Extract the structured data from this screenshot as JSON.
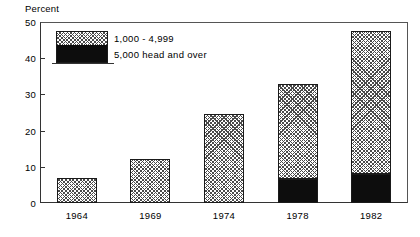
{
  "chart_data": {
    "type": "bar",
    "subtype": "stacked",
    "title": "",
    "ylabel": "Percent",
    "xlabel": "",
    "categories": [
      "1964",
      "1969",
      "1974",
      "1978",
      "1982"
    ],
    "series": [
      {
        "name": "1,000 - 4,999",
        "values": [
          7.0,
          12.2,
          24.5,
          26.3,
          39.5
        ],
        "style": "hatched"
      },
      {
        "name": "5,000 head and over",
        "values": [
          0.0,
          0.0,
          0.0,
          6.7,
          8.1
        ],
        "style": "solid-black"
      }
    ],
    "totals": [
      7.0,
      12.2,
      24.5,
      33.0,
      47.6
    ],
    "ylim": [
      0,
      50
    ],
    "yticks": [
      0,
      10,
      20,
      30,
      40,
      50
    ],
    "ytick_labels": [
      "0",
      "10",
      "20",
      "30",
      "40",
      "50"
    ],
    "grid": false,
    "legend_position": "upper-left-inside",
    "colors": {
      "hatch": "#4a4a4a",
      "solid": "#0d0d0d",
      "axis": "#333333",
      "background": "#ffffff"
    }
  },
  "axis": {
    "y_title": "Percent"
  },
  "legend": {
    "entries": [
      {
        "label": "1,000  -  4,999"
      },
      {
        "label": "5,000  head  and  over"
      }
    ]
  }
}
